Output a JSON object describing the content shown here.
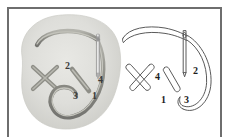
{
  "figure": {
    "type": "embroidery-stitch-diagram",
    "border_color": "#6e6e6e",
    "background_color": "#ffffff"
  },
  "panels": [
    {
      "id": "shaded",
      "name": "shaded-illustration",
      "fabric_color": "#dcdcd8",
      "thread_color": "#9a9a94",
      "needle_color": "#c9c9c9",
      "elements": [
        {
          "name": "fabric-blob"
        },
        {
          "name": "completed-cross-stitch"
        },
        {
          "name": "diagonal-stitch"
        },
        {
          "name": "needle"
        },
        {
          "name": "thread-top"
        },
        {
          "name": "thread-loop"
        }
      ],
      "labels": [
        {
          "id": "1",
          "text": "1"
        },
        {
          "id": "2",
          "text": "2"
        },
        {
          "id": "3",
          "text": "3"
        },
        {
          "id": "4",
          "text": "4"
        }
      ]
    },
    {
      "id": "outline",
      "name": "line-art-illustration",
      "line_color": "#5a5a5a",
      "elements": [
        {
          "name": "completed-cross-stitch-outline"
        },
        {
          "name": "diagonal-stitch-outline"
        },
        {
          "name": "needle-outline"
        },
        {
          "name": "thread-top-outline"
        },
        {
          "name": "thread-loop-outline"
        }
      ],
      "labels": [
        {
          "id": "1",
          "text": "1"
        },
        {
          "id": "2",
          "text": "2"
        },
        {
          "id": "3",
          "text": "3"
        },
        {
          "id": "4",
          "text": "4"
        }
      ]
    }
  ]
}
